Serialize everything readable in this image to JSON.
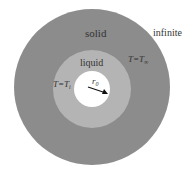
{
  "labels": {
    "solid": "solid",
    "liquid": "liquid",
    "infinite": "infinite",
    "t_outer_T": "T=T",
    "t_outer_sub": "∞",
    "t_inner_T": "T=T",
    "t_inner_sub": "i",
    "radius": "r",
    "radius_sub": "0"
  },
  "colors": {
    "solid": "#8c8c8c",
    "liquid": "#b4b4b4",
    "core": "#ffffff",
    "text": "#333333",
    "background": "#ffffff"
  }
}
